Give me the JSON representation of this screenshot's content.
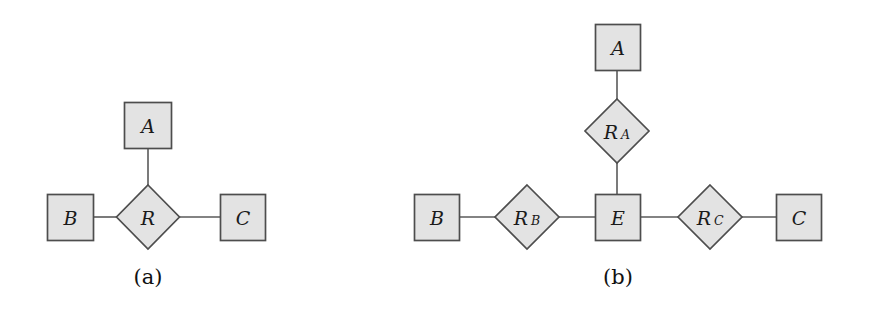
{
  "figure": {
    "background_color": "#ffffff",
    "shape_fill_color": "#e3e3e3",
    "shape_border_color": "#4d4d4d",
    "edge_color": "#5a5a5a",
    "text_color": "#1a1a1a",
    "width": 874,
    "height": 325
  },
  "diagram_a": {
    "caption": "(a)",
    "entity_a_label": "A",
    "entity_b_label": "B",
    "entity_c_label": "C",
    "relationship_r_label": "R"
  },
  "diagram_b": {
    "caption": "(b)",
    "entity_a_label": "A",
    "entity_b_label": "B",
    "entity_c_label": "C",
    "entity_e_label": "E",
    "relationship_ra_base": "R",
    "relationship_ra_sub": "A",
    "relationship_rb_base": "R",
    "relationship_rb_sub": "B",
    "relationship_rc_base": "R",
    "relationship_rc_sub": "C"
  }
}
